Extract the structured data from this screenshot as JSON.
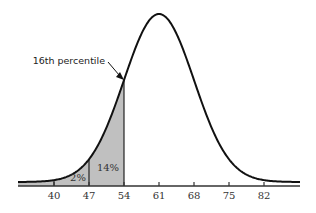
{
  "chart_data": {
    "type": "area",
    "title": "",
    "xlabel": "",
    "ylabel": "",
    "distribution": "normal",
    "mean": 61,
    "sd": 7,
    "xlim": [
      31,
      89
    ],
    "x_ticks": [
      40,
      47,
      54,
      61,
      68,
      75,
      82
    ],
    "x_tick_labels": [
      "40",
      "47",
      "54",
      "61",
      "68",
      "75",
      "82"
    ],
    "grid": false,
    "shaded_region": {
      "from": 31,
      "to": 54,
      "color": "#c0c0c0"
    },
    "segments": [
      {
        "from": 40,
        "to": 47,
        "label": "2%",
        "value": 2
      },
      {
        "from": 47,
        "to": 54,
        "label": "14%",
        "value": 14
      }
    ],
    "annotations": [
      {
        "text": "16th percentile",
        "x": 54,
        "arrow": true
      }
    ]
  },
  "colors": {
    "curve": "#111111",
    "shade": "#c0c0c0",
    "axis": "#333333",
    "background": "#ffffff"
  }
}
